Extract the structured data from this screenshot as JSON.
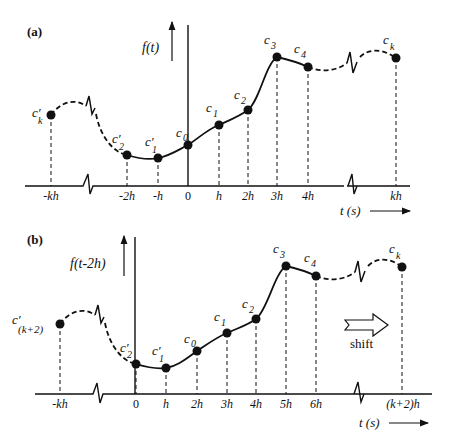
{
  "panel_a": {
    "label": "(a)",
    "y_axis_label": "f(t)",
    "x_axis_label": "t (s)",
    "tick_labels": [
      "-kh",
      "-2h",
      "-h",
      "0",
      "h",
      "2h",
      "3h",
      "4h",
      "kh"
    ],
    "point_labels": {
      "ck_prime": "c'k",
      "c2_prime": "c'2",
      "c1_prime": "c'1",
      "c0": "c0",
      "c1": "c1",
      "c2": "c2",
      "c3": "c3",
      "c4": "c4",
      "ck": "ck"
    }
  },
  "panel_b": {
    "label": "(b)",
    "y_axis_label": "f(t-2h)",
    "x_axis_label": "t (s)",
    "tick_labels": [
      "-kh",
      "0",
      "h",
      "2h",
      "3h",
      "4h",
      "5h",
      "6h",
      "(k+2)h"
    ],
    "point_labels": {
      "ck2_prime": "c'(k+2)",
      "c2_prime": "c'2",
      "c1_prime": "c'1",
      "c0": "c0",
      "c1": "c1",
      "c2": "c2",
      "c3": "c3",
      "c4": "c4",
      "ck": "ck"
    },
    "shift_label": "shift"
  }
}
